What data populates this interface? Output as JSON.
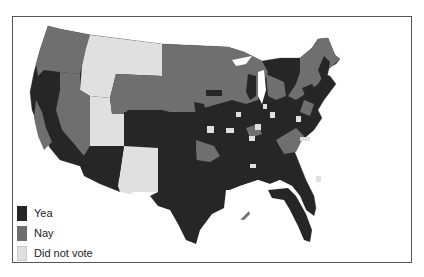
{
  "map": {
    "type": "choropleth",
    "region": "Contiguous United States (congressional districts)",
    "colors": {
      "yea": "#262626",
      "nay": "#6f6f6f",
      "did_not_vote": "#e0e0e0",
      "background": "#ffffff",
      "border": "#555555"
    }
  },
  "legend": {
    "items": [
      {
        "label": "Yea",
        "color": "#262626"
      },
      {
        "label": "Nay",
        "color": "#6f6f6f"
      },
      {
        "label": "Did not vote",
        "color": "#e0e0e0"
      }
    ]
  }
}
